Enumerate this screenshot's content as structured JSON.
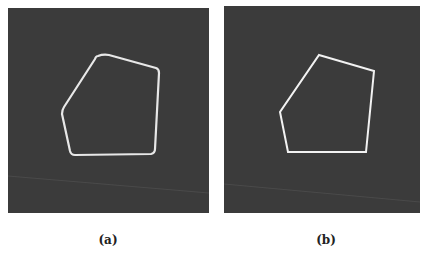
{
  "figure": {
    "panels": [
      {
        "id": "a",
        "label": "(a)",
        "background": "#3b3b3b",
        "stroke": "#e8e8e8",
        "shape": "rounded pentagon contour",
        "vertices": [
          [
            95,
            46
          ],
          [
            151,
            61
          ],
          [
            147,
            145
          ],
          [
            63,
            147
          ],
          [
            54,
            102
          ]
        ]
      },
      {
        "id": "b",
        "label": "(b)",
        "background": "#3b3b3b",
        "stroke": "#f2f2f2",
        "shape": "polygon approximation",
        "vertices": [
          [
            95,
            49
          ],
          [
            150,
            65
          ],
          [
            142,
            146
          ],
          [
            64,
            146
          ],
          [
            56,
            106
          ]
        ]
      }
    ]
  }
}
